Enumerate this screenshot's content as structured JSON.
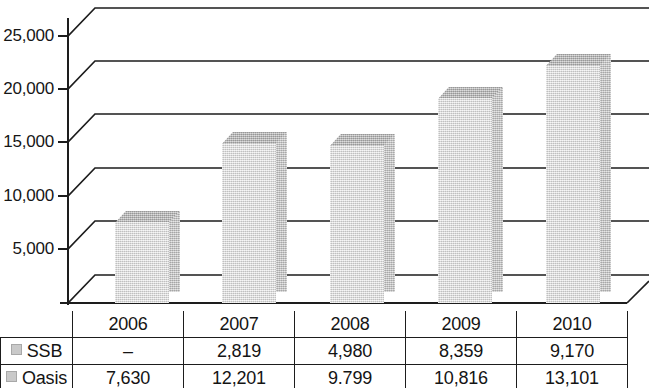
{
  "chart_data": {
    "type": "bar",
    "title": "",
    "subtitle": "",
    "xlabel": "",
    "ylabel": "",
    "categories": [
      "2006",
      "2007",
      "2008",
      "2009",
      "2010"
    ],
    "ylim": [
      0,
      26500
    ],
    "yticks": [
      5000,
      10000,
      15000,
      20000,
      25000
    ],
    "ytick_labels": [
      "5,000",
      "10,000",
      "15,000",
      "20,000",
      "25,000"
    ],
    "grid": true,
    "legend_position": "table-row-labels",
    "style": "3d-column",
    "note": "Each column is the stacked total of SSB + Oasis for that year; values shown in the data table beneath the plot.",
    "series": [
      {
        "name": "SSB",
        "values": [
          null,
          2819,
          4980,
          8359,
          9170
        ],
        "display_values": [
          "–",
          "2,819",
          "4,980",
          "8,359",
          "9,170"
        ]
      },
      {
        "name": "Oasis",
        "values": [
          7630,
          12201,
          9799,
          10816,
          13101
        ],
        "display_values": [
          "7,630",
          "12,201",
          "9.799",
          "10,816",
          "13,101"
        ]
      }
    ],
    "totals": [
      7630,
      15020,
      14779,
      19175,
      22271
    ]
  },
  "axis": {
    "y_tick_labels": [
      "25,000",
      "20,000",
      "15,000",
      "10,000",
      "5,000"
    ]
  },
  "table": {
    "header_row": [
      "",
      "2006",
      "2007",
      "2008",
      "2009",
      "2010"
    ],
    "rows": [
      {
        "label": "SSB",
        "swatch_color": "#c9c9c9",
        "cells": [
          "–",
          "2,819",
          "4,980",
          "8,359",
          "9,170"
        ]
      },
      {
        "label": "Oasis",
        "swatch_color": "#c9c9c9",
        "cells": [
          "7,630",
          "12,201",
          "9.799",
          "10,816",
          "13,101"
        ]
      }
    ]
  },
  "colors": {
    "bar_front": "#dcdcdc",
    "bar_top": "#b6b6b6",
    "bar_side": "#c4c4c4",
    "line": "#1d1d1d",
    "text": "#141414"
  }
}
